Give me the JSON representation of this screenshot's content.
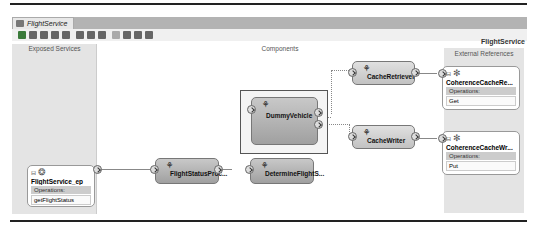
{
  "tab": {
    "title": "FlightService",
    "icon": "composite-icon"
  },
  "toolbar": {
    "icons": [
      "validate-icon",
      "test-icon",
      "deploy-icon",
      "delete-icon",
      "wire-icon",
      "layout-icon",
      "settings-icon",
      "zoom-icon",
      "copy-icon",
      "paste-icon",
      "find-icon",
      "print-icon"
    ]
  },
  "canvas": {
    "title": "FlightService"
  },
  "swimlanes": {
    "exposed": "Exposed Services",
    "components": "Components",
    "external": "External References"
  },
  "exposed_service": {
    "name": "FlightService_ep",
    "ops_header": "Operations:",
    "operations": [
      "getFlightStatus"
    ]
  },
  "components": [
    {
      "name": "FlightStatusProc..."
    },
    {
      "name": "DetermineFlightS..."
    },
    {
      "name": "DummyVehicle"
    },
    {
      "name": "CacheRetriever"
    },
    {
      "name": "CacheWriter"
    }
  ],
  "references": [
    {
      "name": "CoherenceCacheRe...",
      "ops_header": "Operations:",
      "operations": [
        "Get"
      ]
    },
    {
      "name": "CoherenceCacheWr...",
      "ops_header": "Operations:",
      "operations": [
        "Put"
      ]
    }
  ]
}
